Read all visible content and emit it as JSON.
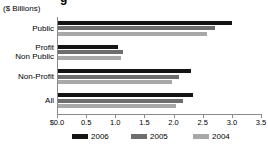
{
  "title_fragment": "g",
  "axis_unit_label": "($ Billions)",
  "chart_data": {
    "type": "bar",
    "orientation": "horizontal",
    "title": "($ Billions)",
    "xlabel": "",
    "ylabel": "",
    "xlim": [
      0.0,
      3.5
    ],
    "xticks": [
      0.0,
      0.5,
      1.0,
      1.5,
      2.0,
      2.5,
      3.0,
      3.5
    ],
    "xticklabels": [
      "$0.0",
      "0.5",
      "1.0",
      "1.5",
      "2.0",
      "2.5",
      "3.0",
      "3.5"
    ],
    "grid": false,
    "legend_position": "bottom",
    "categories": [
      "Public",
      "Profit Non Public",
      "Non-Profit",
      "All"
    ],
    "category_lines": [
      [
        "Public"
      ],
      [
        "Profit",
        "Non Public"
      ],
      [
        "Non-Profit"
      ],
      [
        "All"
      ]
    ],
    "series": [
      {
        "name": "2006",
        "color": "#141414",
        "values": [
          2.98,
          1.03,
          2.29,
          2.32
        ]
      },
      {
        "name": "2005",
        "color": "#6e6e6e",
        "values": [
          2.7,
          1.12,
          2.08,
          2.15
        ]
      },
      {
        "name": "2004",
        "color": "#a8a8a8",
        "values": [
          2.56,
          1.08,
          1.95,
          2.02
        ]
      }
    ]
  },
  "legend": {
    "items": [
      {
        "label": "2006",
        "color": "#141414"
      },
      {
        "label": "2005",
        "color": "#6e6e6e"
      },
      {
        "label": "2004",
        "color": "#a8a8a8"
      }
    ]
  }
}
